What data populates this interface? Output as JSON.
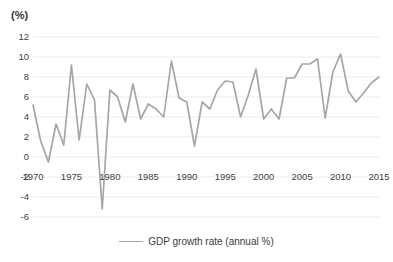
{
  "chart_data": {
    "type": "line",
    "title": "",
    "subtitle": "",
    "xlabel": "",
    "ylabel": "(%)",
    "unit_label": "(%)",
    "grid": true,
    "legend_position": "bottom",
    "xlim": [
      1970,
      2015
    ],
    "ylim": [
      -6,
      12
    ],
    "ytick_step": 2,
    "yticks": [
      "12",
      "10",
      "8",
      "6",
      "4",
      "2",
      "0",
      "-2",
      "-4",
      "-6"
    ],
    "ytick_values": [
      12,
      10,
      8,
      6,
      4,
      2,
      0,
      -2,
      -4,
      -6
    ],
    "xticks": [
      "1970",
      "1975",
      "1980",
      "1985",
      "1990",
      "1995",
      "2000",
      "2005",
      "2010",
      "2015"
    ],
    "xtick_values": [
      1970,
      1975,
      1980,
      1985,
      1990,
      1995,
      2000,
      2005,
      2010,
      2015
    ],
    "x": [
      1970,
      1971,
      1972,
      1973,
      1974,
      1975,
      1976,
      1977,
      1978,
      1979,
      1980,
      1981,
      1982,
      1983,
      1984,
      1985,
      1986,
      1987,
      1988,
      1989,
      1990,
      1991,
      1992,
      1993,
      1994,
      1995,
      1996,
      1997,
      1998,
      1999,
      2000,
      2001,
      2002,
      2003,
      2004,
      2005,
      2006,
      2007,
      2008,
      2009,
      2010,
      2011,
      2012,
      2013,
      2014,
      2015
    ],
    "series": [
      {
        "name": "GDP growth rate (annual %)",
        "color": "#a6a6a6",
        "values": [
          5.2,
          1.6,
          -0.5,
          3.3,
          1.2,
          9.2,
          1.7,
          7.3,
          5.7,
          -5.2,
          6.7,
          6.0,
          3.5,
          7.3,
          3.8,
          5.3,
          4.8,
          4.0,
          9.6,
          5.9,
          5.5,
          1.1,
          5.5,
          4.8,
          6.7,
          7.6,
          7.5,
          4.0,
          6.2,
          8.8,
          3.8,
          4.8,
          3.8,
          7.9,
          7.9,
          9.3,
          9.3,
          9.8,
          3.9,
          8.5,
          10.3,
          6.6,
          5.5,
          6.4,
          7.4,
          8.0
        ]
      }
    ]
  },
  "legend": {
    "entries": [
      {
        "label": "GDP growth rate (annual %)",
        "color": "#a6a6a6"
      }
    ]
  },
  "colors": {
    "line": "#a6a6a6",
    "gridline": "#ebebeb",
    "text": "#3b3b3b",
    "background": "#ffffff"
  }
}
